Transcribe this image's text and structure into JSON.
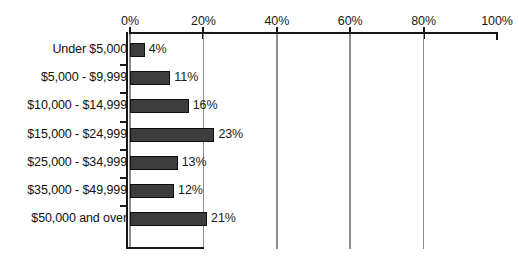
{
  "chart_data": {
    "type": "bar",
    "orientation": "horizontal",
    "title": "",
    "subtitle": "",
    "xlabel": "",
    "ylabel": "",
    "xlim": [
      0,
      100
    ],
    "grid": true,
    "legend": "none",
    "axis_position": "top",
    "value_suffix": "%",
    "categories": [
      "Under $5,000",
      "$5,000 - $9,999",
      "$10,000 - $14,999",
      "$15,000 - $24,999",
      "$25,000 - $34,999",
      "$35,000 - $49,999",
      "$50,000 and over"
    ],
    "values": [
      4,
      11,
      16,
      23,
      13,
      12,
      21
    ],
    "data_labels": [
      "4%",
      "11%",
      "16%",
      "23%",
      "13%",
      "12%",
      "21%"
    ],
    "xticks": [
      0,
      20,
      40,
      60,
      80,
      100
    ],
    "xtick_labels": [
      "0%",
      "20%",
      "40%",
      "60%",
      "80%",
      "100%"
    ],
    "colors": {
      "bar_fill": "#3d3d3d",
      "bar_border": "#0d0d0d",
      "axis": "#171717",
      "gridline": "#8e8e8e",
      "text": "#1a1a1a",
      "background": "#ffffff"
    }
  }
}
